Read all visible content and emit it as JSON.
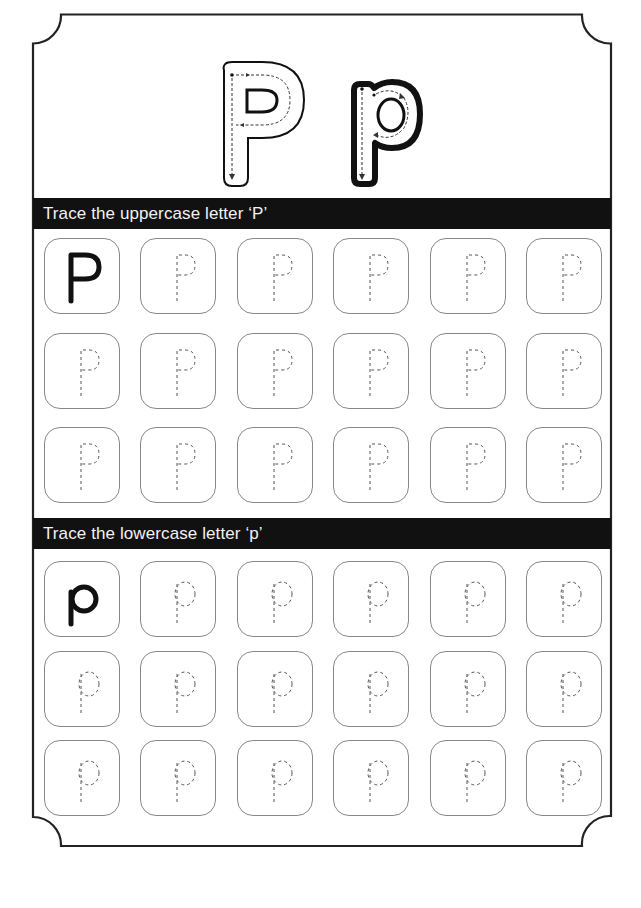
{
  "worksheet": {
    "title_letters": {
      "uppercase": "P",
      "lowercase": "p"
    },
    "sections": [
      {
        "id": "uppercase",
        "heading": "Trace the uppercase letter ‘P’",
        "letter": "P",
        "rows": 3,
        "columns": 6,
        "model_cell": {
          "row": 0,
          "col": 0,
          "style": "solid"
        },
        "trace_cells_style": "dashed"
      },
      {
        "id": "lowercase",
        "heading": "Trace the lowercase letter ‘p’",
        "letter": "p",
        "rows": 3,
        "columns": 6,
        "model_cell": {
          "row": 0,
          "col": 0,
          "style": "solid"
        },
        "trace_cells_style": "dashed"
      }
    ]
  },
  "colors": {
    "frame": "#222222",
    "bar_bg": "#111111",
    "bar_text": "#f2f2f2",
    "cell_border": "#888888",
    "dashed_guide": "#555555",
    "model_letter": "#111111"
  }
}
